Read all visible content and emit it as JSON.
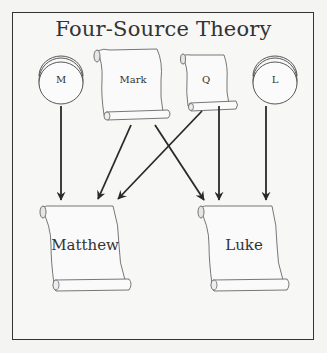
{
  "title": "Four-Source Theory",
  "sources": [
    {
      "id": "M",
      "label": "M",
      "shape": "circle-disc"
    },
    {
      "id": "Mark",
      "label": "Mark",
      "shape": "scroll"
    },
    {
      "id": "Q",
      "label": "Q",
      "shape": "scroll"
    },
    {
      "id": "L",
      "label": "L",
      "shape": "circle-disc"
    }
  ],
  "targets": [
    {
      "id": "Matthew",
      "label": "Matthew",
      "shape": "scroll"
    },
    {
      "id": "Luke",
      "label": "Luke",
      "shape": "scroll"
    }
  ],
  "edges": [
    {
      "from": "M",
      "to": "Matthew"
    },
    {
      "from": "Mark",
      "to": "Matthew"
    },
    {
      "from": "Mark",
      "to": "Luke"
    },
    {
      "from": "Q",
      "to": "Matthew"
    },
    {
      "from": "Q",
      "to": "Luke"
    },
    {
      "from": "L",
      "to": "Luke"
    }
  ],
  "colors": {
    "stroke": "#333333",
    "background": "#f7f7f6",
    "scroll_fill": "#fafafa"
  }
}
